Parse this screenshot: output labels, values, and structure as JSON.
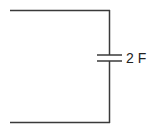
{
  "diagram": {
    "type": "circuit",
    "components": [
      {
        "kind": "capacitor",
        "label": "2 F"
      }
    ],
    "colors": {
      "wire": "#3a3a3a",
      "text": "#222222"
    }
  }
}
